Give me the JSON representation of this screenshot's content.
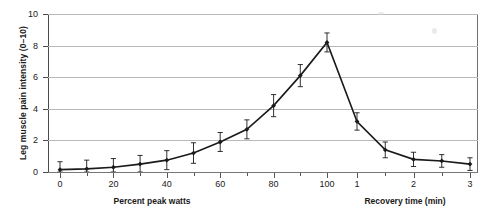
{
  "chart_data": {
    "type": "line",
    "title": "",
    "subtitle": "",
    "ylabel": "Leg muscle pain intensity (0–10)",
    "xlabel_left": "Percent peak watts",
    "xlabel_right": "Recovery time (min)",
    "ylim": [
      0,
      10
    ],
    "yticks": [
      0,
      2,
      4,
      6,
      8,
      10
    ],
    "ytick_labels": [
      "0",
      "2",
      "4",
      "6",
      "8",
      "10"
    ],
    "grid": "horizontal",
    "legend": "none",
    "xticks_exercise": [
      0,
      10,
      20,
      30,
      40,
      50,
      60,
      70,
      80,
      90,
      100
    ],
    "xtick_labels_exercise": [
      "0",
      "",
      "20",
      "",
      "40",
      "",
      "60",
      "",
      "80",
      "",
      "100"
    ],
    "xticks_recovery": [
      1,
      1.5,
      2,
      2.5,
      3
    ],
    "xtick_labels_recovery": [
      "1",
      "",
      "2",
      "",
      "3"
    ],
    "marker": "filled-diamond",
    "errorbars": true,
    "series": [
      {
        "name": "Leg muscle pain intensity",
        "phase_exercise": {
          "x": [
            0,
            10,
            20,
            30,
            40,
            50,
            60,
            70,
            80,
            90,
            100
          ],
          "y": [
            0.15,
            0.2,
            0.3,
            0.5,
            0.75,
            1.2,
            1.9,
            2.7,
            4.2,
            6.1,
            8.2
          ],
          "yerr": [
            0.5,
            0.55,
            0.55,
            0.55,
            0.6,
            0.65,
            0.6,
            0.6,
            0.7,
            0.7,
            0.6
          ]
        },
        "phase_recovery": {
          "x": [
            1,
            1.5,
            2,
            2.5,
            3
          ],
          "y": [
            3.2,
            1.4,
            0.8,
            0.7,
            0.5
          ],
          "yerr": [
            0.55,
            0.5,
            0.45,
            0.4,
            0.4
          ]
        }
      }
    ]
  },
  "colors": {
    "line": "#1a1a1a",
    "marker": "#1a1a1a",
    "grid": "#b9b9b9",
    "axis": "#555555",
    "background": "#ffffff"
  }
}
